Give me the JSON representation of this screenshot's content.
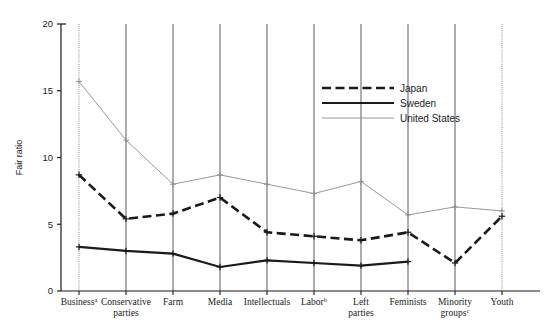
{
  "chart_data": {
    "type": "line",
    "title": "",
    "xlabel": "",
    "ylabel": "Fair ratio",
    "ylim": [
      0,
      20
    ],
    "yticks": [
      0,
      5,
      10,
      15,
      20
    ],
    "ytick_labels": [
      "0",
      "5",
      "10",
      "15",
      "20"
    ],
    "grid": "vertical-only",
    "legend_position": "upper-center-right",
    "categories": [
      "Business",
      "Conservative parties",
      "Farm",
      "Media",
      "Intellectuals",
      "Labor",
      "Left parties",
      "Feminists",
      "Minority groups",
      "Youth"
    ],
    "category_labels": [
      {
        "line1": "Business",
        "sup": "a",
        "line2": ""
      },
      {
        "line1": "Conservative",
        "sup": "",
        "line2": "parties"
      },
      {
        "line1": "Farm",
        "sup": "",
        "line2": ""
      },
      {
        "line1": "Media",
        "sup": "",
        "line2": ""
      },
      {
        "line1": "Intellectuals",
        "sup": "",
        "line2": ""
      },
      {
        "line1": "Labor",
        "sup": "b",
        "line2": ""
      },
      {
        "line1": "Left",
        "sup": "",
        "line2": "parties"
      },
      {
        "line1": "Feminists",
        "sup": "",
        "line2": ""
      },
      {
        "line1": "Minority",
        "sup": "c",
        "line2": "groups"
      },
      {
        "line1": "Youth",
        "sup": "",
        "line2": ""
      }
    ],
    "series": [
      {
        "name": "Japan",
        "style": "dashed",
        "color": "#1a1a1a",
        "width": 2.6,
        "values": [
          8.7,
          5.4,
          5.8,
          7.0,
          4.4,
          4.1,
          3.8,
          4.4,
          2.1,
          5.6
        ]
      },
      {
        "name": "Sweden",
        "style": "solid",
        "color": "#1a1a1a",
        "width": 2.2,
        "values": [
          3.3,
          3.0,
          2.8,
          1.8,
          2.3,
          2.1,
          1.9,
          2.2,
          null,
          null
        ]
      },
      {
        "name": "United States",
        "style": "thin",
        "color": "#8c8c8c",
        "width": 0.9,
        "values": [
          15.7,
          11.3,
          8.0,
          8.7,
          8.0,
          7.3,
          8.2,
          5.7,
          6.3,
          6.0
        ]
      }
    ]
  },
  "legend": {
    "entries": [
      {
        "label": "Japan",
        "style": "dashed"
      },
      {
        "label": "Sweden",
        "style": "solid"
      },
      {
        "label": "United States",
        "style": "thin"
      }
    ]
  },
  "axes": {
    "y_title": "Fair ratio"
  }
}
